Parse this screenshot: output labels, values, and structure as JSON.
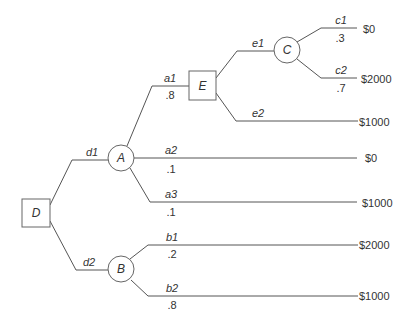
{
  "diagram": {
    "type": "decision-tree",
    "nodes": {
      "D": {
        "label": "D",
        "kind": "decision"
      },
      "A": {
        "label": "A",
        "kind": "chance"
      },
      "B": {
        "label": "B",
        "kind": "chance"
      },
      "E": {
        "label": "E",
        "kind": "decision"
      },
      "C": {
        "label": "C",
        "kind": "chance"
      }
    },
    "branches": {
      "d1": {
        "label": "d1",
        "prob": ""
      },
      "d2": {
        "label": "d2",
        "prob": ""
      },
      "a1": {
        "label": "a1",
        "prob": ".8"
      },
      "a2": {
        "label": "a2",
        "prob": ".1",
        "payoff": "$0"
      },
      "a3": {
        "label": "a3",
        "prob": ".1",
        "payoff": "$1000"
      },
      "e1": {
        "label": "e1",
        "prob": ""
      },
      "e2": {
        "label": "e2",
        "prob": "",
        "payoff": "$1000"
      },
      "c1": {
        "label": "c1",
        "prob": ".3",
        "payoff": "$0"
      },
      "c2": {
        "label": "c2",
        "prob": ".7",
        "payoff": "$2000"
      },
      "b1": {
        "label": "b1",
        "prob": ".2",
        "payoff": "$2000"
      },
      "b2": {
        "label": "b2",
        "prob": ".8",
        "payoff": "$1000"
      }
    },
    "colors": {
      "line": "#555555",
      "text": "#333333",
      "background": "#ffffff"
    }
  }
}
